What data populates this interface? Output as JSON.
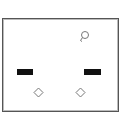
{
  "diagram": {
    "type": "socket-faceplate",
    "frame": {
      "border_color": "#555555",
      "background": "#ffffff"
    },
    "slots": [
      {
        "name": "left-slot",
        "x": 17,
        "y": 69,
        "w": 16,
        "h": 6,
        "color": "#111111"
      },
      {
        "name": "right-slot",
        "x": 84,
        "y": 69,
        "w": 17,
        "h": 6,
        "color": "#111111"
      }
    ],
    "icons": [
      {
        "name": "bulb-icon",
        "x": 80,
        "y": 32
      },
      {
        "name": "diamond-icon-left",
        "x": 33,
        "y": 88
      },
      {
        "name": "diamond-icon-right",
        "x": 75,
        "y": 88
      }
    ]
  }
}
